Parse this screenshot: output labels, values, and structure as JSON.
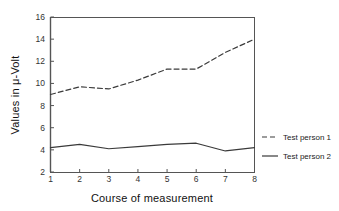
{
  "chart_data": {
    "type": "line",
    "title": "",
    "xlabel": "Course of measurement",
    "ylabel": "Values in μ-Volt",
    "x": [
      1,
      2,
      3,
      4,
      5,
      6,
      7,
      8
    ],
    "xlim": [
      1,
      8
    ],
    "ylim": [
      2,
      16
    ],
    "xticks": [
      "1",
      "2",
      "3",
      "4",
      "5",
      "6",
      "7",
      "8"
    ],
    "yticks": [
      "2",
      "4",
      "6",
      "8",
      "10",
      "12",
      "14",
      "16"
    ],
    "grid": false,
    "legend_position": "right",
    "series": [
      {
        "name": "Test person 1",
        "style": "dashed",
        "color": "#3a3a3a",
        "values": [
          9.0,
          9.7,
          9.5,
          10.3,
          11.3,
          11.3,
          12.8,
          14.0
        ]
      },
      {
        "name": "Test person 2",
        "style": "solid",
        "color": "#3a3a3a",
        "values": [
          4.2,
          4.5,
          4.1,
          4.3,
          4.5,
          4.6,
          3.9,
          4.2
        ]
      }
    ]
  },
  "axes": {
    "y_title": "Values in μ-Volt",
    "x_title": "Course of measurement",
    "y_tick_labels": [
      "16",
      "14",
      "12",
      "10",
      "8",
      "6",
      "4",
      "2"
    ],
    "x_tick_labels": [
      "1",
      "2",
      "3",
      "4",
      "5",
      "6",
      "7",
      "8"
    ]
  },
  "legend": {
    "entries": [
      {
        "label": "Test person 1",
        "style": "dashed"
      },
      {
        "label": "Test person 2",
        "style": "solid"
      }
    ]
  },
  "colors": {
    "axis": "#555555",
    "line": "#3a3a3a",
    "text": "#111111",
    "background": "#ffffff"
  }
}
